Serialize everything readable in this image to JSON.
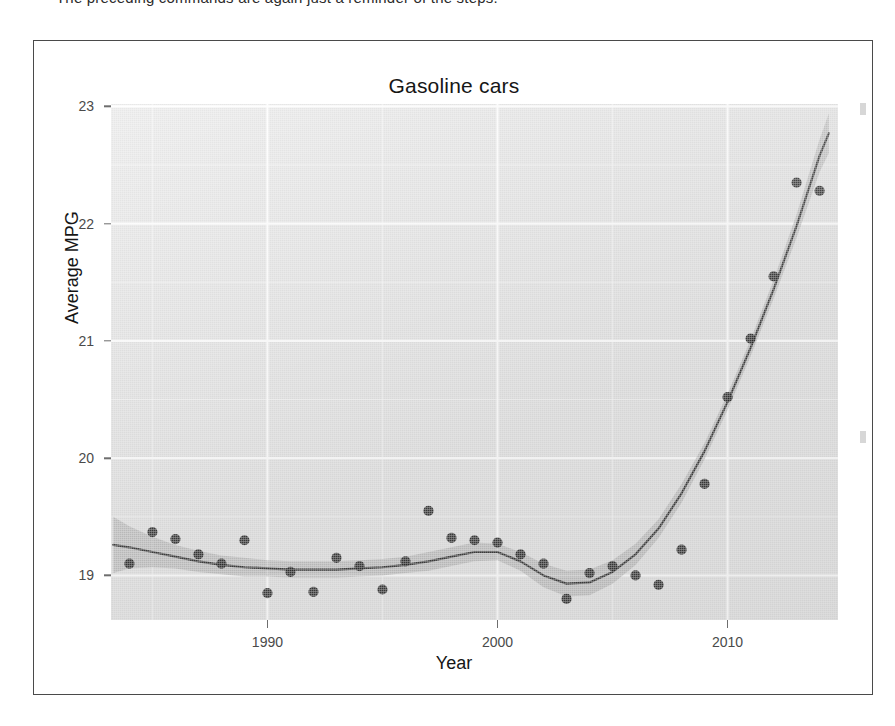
{
  "page": {
    "top_text_line": "The preceding commands are again just a reminder of the steps."
  },
  "chart": {
    "title": "Gasoline cars",
    "x_axis_title": "Year",
    "y_axis_title": "Average MPG",
    "y_tick_labels": [
      "23",
      "22",
      "21",
      "20",
      "19"
    ],
    "x_tick_labels": [
      "1990",
      "2000",
      "2010"
    ],
    "panel_background_color": "#e2e2e2",
    "gridline_color": "#ffffff",
    "point_color": "#2a2a2a",
    "trend_line_color": "#3c3c3c",
    "confidence_band_color": "#9a9a9a"
  },
  "chart_data": {
    "type": "scatter",
    "title": "Gasoline cars",
    "xlabel": "Year",
    "ylabel": "Average MPG",
    "xlim": [
      1983.2,
      2014.8
    ],
    "ylim": [
      18.62,
      23.02
    ],
    "grid": true,
    "legend": "none",
    "x_ticks": [
      1990,
      2000,
      2010
    ],
    "y_ticks": [
      19,
      20,
      21,
      22,
      23
    ],
    "series": [
      {
        "name": "Average MPG (observed)",
        "type": "scatter",
        "marker": "filled-circle",
        "x": [
          1984,
          1985,
          1986,
          1987,
          1988,
          1989,
          1990,
          1991,
          1992,
          1993,
          1994,
          1995,
          1996,
          1997,
          1998,
          1999,
          2000,
          2001,
          2002,
          2003,
          2004,
          2005,
          2006,
          2007,
          2008,
          2009,
          2010,
          2011,
          2012,
          2013,
          2014
        ],
        "y": [
          19.1,
          19.37,
          19.31,
          19.18,
          19.1,
          19.3,
          18.85,
          19.03,
          18.86,
          19.15,
          19.08,
          18.88,
          19.12,
          19.55,
          19.32,
          19.3,
          19.28,
          19.18,
          19.1,
          18.8,
          19.02,
          19.08,
          19.0,
          18.92,
          19.22,
          19.78,
          20.52,
          21.02,
          21.55,
          22.35,
          22.28
        ]
      },
      {
        "name": "LOESS smooth fit",
        "type": "line",
        "x": [
          1983.3,
          1984,
          1985,
          1986,
          1987,
          1988,
          1989,
          1990,
          1991,
          1992,
          1993,
          1994,
          1995,
          1996,
          1997,
          1998,
          1999,
          2000,
          2001,
          2002,
          2003,
          2004,
          2005,
          2006,
          2007,
          2008,
          2009,
          2010,
          2011,
          2012,
          2013,
          2014,
          2014.4
        ],
        "y": [
          19.26,
          19.24,
          19.2,
          19.16,
          19.12,
          19.09,
          19.07,
          19.06,
          19.05,
          19.05,
          19.05,
          19.06,
          19.07,
          19.09,
          19.12,
          19.16,
          19.2,
          19.2,
          19.12,
          19.0,
          18.93,
          18.94,
          19.03,
          19.18,
          19.4,
          19.7,
          20.06,
          20.48,
          20.94,
          21.44,
          21.98,
          22.58,
          22.77
        ]
      },
      {
        "name": "95% confidence band (lower)",
        "type": "line",
        "x": [
          1983.3,
          1984,
          1985,
          1986,
          1987,
          1988,
          1989,
          1990,
          1991,
          1992,
          1993,
          1994,
          1995,
          1996,
          1997,
          1998,
          1999,
          2000,
          2001,
          2002,
          2003,
          2004,
          2005,
          2006,
          2007,
          2008,
          2009,
          2010,
          2011,
          2012,
          2013,
          2014,
          2014.4
        ],
        "y": [
          19.02,
          19.06,
          19.07,
          19.06,
          19.03,
          19.01,
          18.99,
          18.99,
          18.98,
          18.98,
          18.98,
          18.99,
          19.0,
          19.02,
          19.04,
          19.08,
          19.12,
          19.13,
          19.04,
          18.9,
          18.82,
          18.83,
          18.93,
          19.09,
          19.32,
          19.62,
          19.99,
          20.41,
          20.87,
          21.36,
          21.88,
          22.44,
          22.6
        ]
      },
      {
        "name": "95% confidence band (upper)",
        "type": "line",
        "x": [
          1983.3,
          1984,
          1985,
          1986,
          1987,
          1988,
          1989,
          1990,
          1991,
          1992,
          1993,
          1994,
          1995,
          1996,
          1997,
          1998,
          1999,
          2000,
          2001,
          2002,
          2003,
          2004,
          2005,
          2006,
          2007,
          2008,
          2009,
          2010,
          2011,
          2012,
          2013,
          2014,
          2014.4
        ],
        "y": [
          19.5,
          19.42,
          19.33,
          19.26,
          19.21,
          19.17,
          19.15,
          19.13,
          19.12,
          19.12,
          19.12,
          19.13,
          19.14,
          19.16,
          19.2,
          19.24,
          19.28,
          19.27,
          19.2,
          19.1,
          19.04,
          19.05,
          19.13,
          19.27,
          19.48,
          19.78,
          20.13,
          20.55,
          21.01,
          21.52,
          22.08,
          22.72,
          22.94
        ]
      }
    ]
  }
}
